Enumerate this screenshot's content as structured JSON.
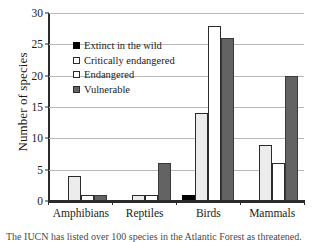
{
  "chart_data": {
    "type": "bar",
    "title": "",
    "xlabel": "",
    "ylabel": "Number of species",
    "ylim": [
      0,
      30
    ],
    "yticks": [
      0,
      5,
      10,
      15,
      20,
      25,
      30
    ],
    "ytick_labels": [
      "0",
      "5",
      "10",
      "15",
      "20",
      "25",
      "30"
    ],
    "grid": "horizontal",
    "legend_position": "upper-left-inside",
    "categories": [
      "Amphibians",
      "Reptiles",
      "Birds",
      "Mammals"
    ],
    "series": [
      {
        "name": "Extinct in the wild",
        "marker": "filled-black-square",
        "color": "#000000",
        "values": [
          0,
          0,
          1,
          0
        ]
      },
      {
        "name": "Critically endangered",
        "marker": "open-square",
        "color": "#ececec",
        "values": [
          4,
          1,
          14,
          9
        ]
      },
      {
        "name": "Endangered",
        "marker": "open-square",
        "color": "#ffffff",
        "values": [
          1,
          1,
          28,
          6
        ]
      },
      {
        "name": "Vulnerable",
        "marker": "filled-gray-square",
        "color": "#636363",
        "values": [
          1,
          6,
          26,
          20
        ]
      }
    ]
  },
  "caption": "The IUCN has listed over 100 species in the Atlantic Forest as threatened."
}
